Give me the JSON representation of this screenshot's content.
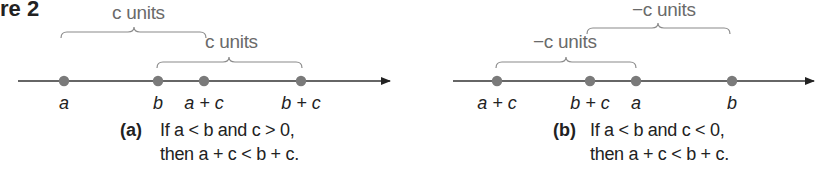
{
  "figure": {
    "label": "re 2"
  },
  "panels": [
    {
      "id": "a",
      "tag": "(a)",
      "caption_line1": "If a < b and c > 0,",
      "caption_line2": "then a + c < b + c.",
      "axis": {
        "x1": 18,
        "x2": 390,
        "y": 81
      },
      "points": [
        {
          "label": "a",
          "x": 64
        },
        {
          "label": "b",
          "x": 158
        },
        {
          "label": "a + c",
          "x": 204
        },
        {
          "label": "b + c",
          "x": 301
        }
      ],
      "braces": [
        {
          "label": "c units",
          "x1": 61,
          "x2": 206,
          "y": 38,
          "label_x": 112,
          "label_y": 2
        },
        {
          "label": "c units",
          "x1": 157,
          "x2": 302,
          "y": 68,
          "label_x": 205,
          "label_y": 31
        }
      ]
    },
    {
      "id": "b",
      "tag": "(b)",
      "caption_line1": "If a < b and c < 0,",
      "caption_line2": "then a + c < b + c.",
      "axis": {
        "x1": 453,
        "x2": 815,
        "y": 81
      },
      "points": [
        {
          "label": "a + c",
          "x": 497
        },
        {
          "label": "b + c",
          "x": 590
        },
        {
          "label": "a",
          "x": 636
        },
        {
          "label": "b",
          "x": 732
        }
      ],
      "braces": [
        {
          "label": "−c units",
          "x1": 587,
          "x2": 730,
          "y": 34,
          "label_x": 632,
          "label_y": -1
        },
        {
          "label": "−c units",
          "x1": 496,
          "x2": 636,
          "y": 68,
          "label_x": 533,
          "label_y": 31
        }
      ]
    }
  ],
  "colors": {
    "axis": "#333333",
    "point": "#7a7a7a",
    "brace": "#8a8a8a",
    "text": "#222222"
  }
}
